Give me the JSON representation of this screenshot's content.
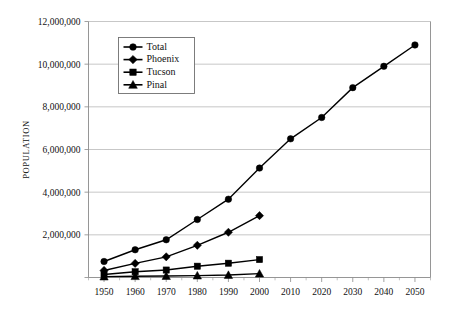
{
  "chart_data": {
    "type": "line",
    "title": "",
    "xlabel": "",
    "ylabel": "POPULATION",
    "x": [
      1950,
      1960,
      1970,
      1980,
      1990,
      2000,
      2010,
      2020,
      2030,
      2040,
      2050
    ],
    "xlim": [
      1945,
      2055
    ],
    "ylim": [
      0,
      12000000
    ],
    "ytick_values": [
      0,
      2000000,
      4000000,
      6000000,
      8000000,
      10000000,
      12000000
    ],
    "ytick_labels": [
      "",
      "2,000,000",
      "4,000,000",
      "6,000,000",
      "8,000,000",
      "10,000,000",
      "12,000,000"
    ],
    "xtick_labels": [
      "1950",
      "1960",
      "1970",
      "1980",
      "1990",
      "2000",
      "2010",
      "2020",
      "2030",
      "2040",
      "2050"
    ],
    "grid": true,
    "legend_position": "upper-left-inside",
    "series": [
      {
        "name": "Total",
        "marker": "circle",
        "x": [
          1950,
          1960,
          1970,
          1980,
          1990,
          2000,
          2010,
          2020,
          2030,
          2040,
          2050
        ],
        "values": [
          750000,
          1300000,
          1770000,
          2720000,
          3670000,
          5130000,
          6500000,
          7500000,
          8900000,
          9900000,
          10900000
        ]
      },
      {
        "name": "Phoenix",
        "marker": "diamond",
        "x": [
          1950,
          1960,
          1970,
          1980,
          1990,
          2000
        ],
        "values": [
          330000,
          660000,
          970000,
          1510000,
          2120000,
          2900000
        ]
      },
      {
        "name": "Tucson",
        "marker": "square",
        "x": [
          1950,
          1960,
          1970,
          1980,
          1990,
          2000
        ],
        "values": [
          140000,
          270000,
          350000,
          530000,
          670000,
          840000
        ]
      },
      {
        "name": "Pinal",
        "marker": "triangle",
        "x": [
          1950,
          1960,
          1970,
          1980,
          1990,
          2000
        ],
        "values": [
          43000,
          62000,
          68000,
          90000,
          116000,
          180000
        ]
      }
    ],
    "legend": [
      {
        "label": "Total",
        "marker": "circle"
      },
      {
        "label": "Phoenix",
        "marker": "diamond"
      },
      {
        "label": "Tucson",
        "marker": "square"
      },
      {
        "label": "Pinal",
        "marker": "triangle"
      }
    ],
    "colors": {
      "series": "#000000",
      "grid": "#b9b9b9",
      "axis": "#8a8a8a",
      "background": "#ffffff"
    }
  }
}
